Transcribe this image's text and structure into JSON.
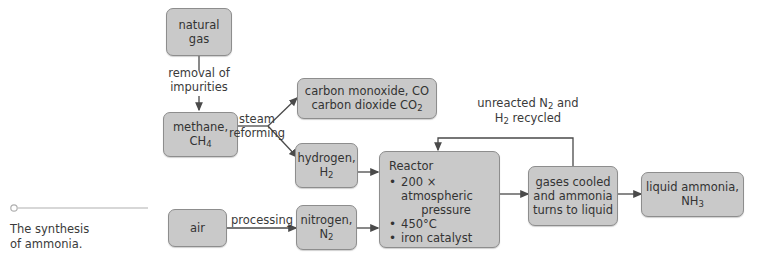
{
  "diagram": {
    "title": "The synthesis of ammonia.",
    "caption_lines": [
      "The synthesis",
      "of ammonia."
    ],
    "colors": {
      "background": "#ffffff",
      "node_fill": "#c9c9c9",
      "node_border": "#8d8d8d",
      "text": "#3a3a3a",
      "arrow": "#4a4a4a",
      "caption_rule": "#b0b0b0"
    },
    "nodes": [
      {
        "id": "natural-gas",
        "lines": [
          "natural",
          "gas"
        ]
      },
      {
        "id": "methane",
        "lines": [
          "methane,",
          "CH4"
        ]
      },
      {
        "id": "carbon-oxides",
        "lines": [
          "carbon monoxide, CO",
          "carbon dioxide CO2"
        ]
      },
      {
        "id": "hydrogen",
        "lines": [
          "hydrogen,",
          "H2"
        ]
      },
      {
        "id": "air",
        "lines": [
          "air"
        ]
      },
      {
        "id": "nitrogen",
        "lines": [
          "nitrogen,",
          "N2"
        ]
      },
      {
        "id": "reactor",
        "title": "Reactor",
        "bullets": [
          {
            "text": "200 × atmospheric",
            "continuation": "pressure"
          },
          {
            "text": "450°C"
          },
          {
            "text": "iron catalyst"
          }
        ]
      },
      {
        "id": "cooling",
        "lines": [
          "gases cooled",
          "and ammonia",
          "turns to liquid"
        ]
      },
      {
        "id": "product",
        "lines": [
          "liquid ammonia,",
          "NH3"
        ]
      }
    ],
    "edge_labels": [
      {
        "id": "removal",
        "lines": [
          "removal of",
          "impurities"
        ]
      },
      {
        "id": "steam-reforming",
        "lines": [
          "steam",
          "reforming"
        ]
      },
      {
        "id": "processing",
        "lines": [
          "processing"
        ]
      },
      {
        "id": "recycle",
        "lines": [
          "unreacted N2 and",
          "H2 recycled"
        ]
      }
    ]
  }
}
